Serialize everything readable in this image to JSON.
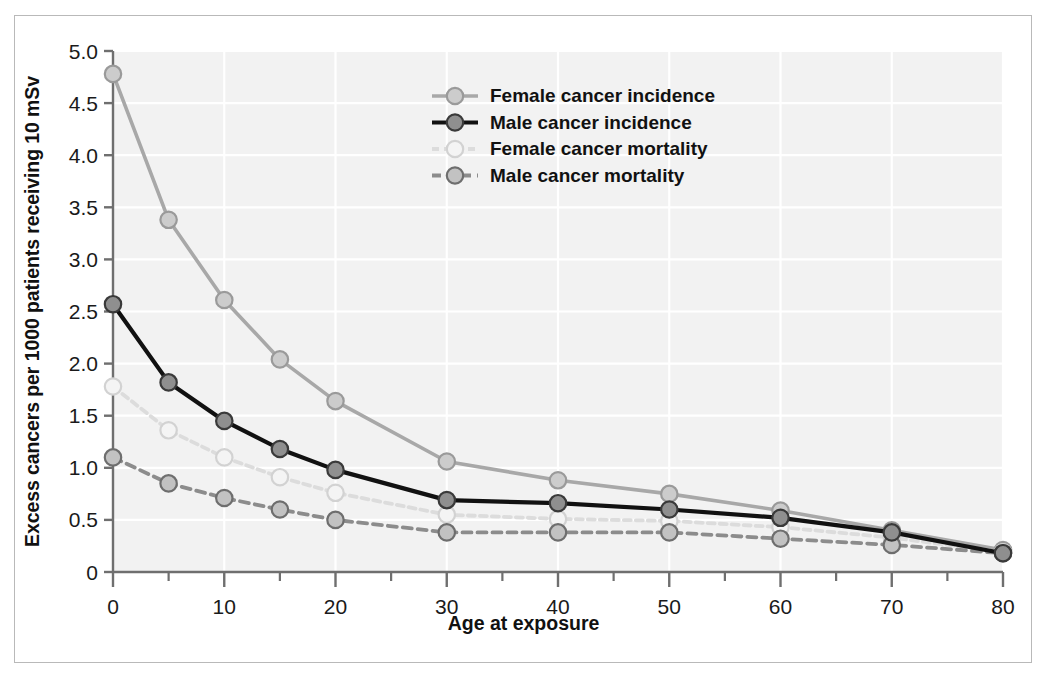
{
  "chart_data": {
    "type": "line",
    "title": "",
    "xlabel": "Age at exposure",
    "ylabel": "Excess cancers per 1000 patients receiving 10 mSv",
    "x": [
      0,
      5,
      10,
      15,
      20,
      30,
      40,
      50,
      60,
      70,
      80
    ],
    "xlim": [
      0,
      80
    ],
    "ylim": [
      0,
      5.0
    ],
    "xticks": [
      0,
      10,
      20,
      30,
      40,
      50,
      60,
      70,
      80
    ],
    "xtick_labels": [
      "0",
      "10",
      "20",
      "30",
      "40",
      "50",
      "60",
      "70",
      "80"
    ],
    "xminor_ticks": [
      5,
      15,
      25,
      35,
      45,
      55,
      65,
      75
    ],
    "yticks": [
      0,
      0.5,
      1.0,
      1.5,
      2.0,
      2.5,
      3.0,
      3.5,
      4.0,
      4.5,
      5.0
    ],
    "ytick_labels": [
      "0",
      "0.5",
      "1.0",
      "1.5",
      "2.0",
      "2.5",
      "3.0",
      "3.5",
      "4.0",
      "4.5",
      "5.0"
    ],
    "grid": true,
    "grid_color": "#ffffff",
    "plot_background": "#f2f2f2",
    "legend_position": "top-center",
    "series": [
      {
        "name": "Female cancer incidence",
        "values": [
          4.78,
          3.38,
          2.61,
          2.04,
          1.64,
          1.06,
          0.88,
          0.75,
          0.59,
          0.4,
          0.21
        ],
        "color": "#a8a8a8",
        "marker_fill": "#cccccc",
        "style": "solid"
      },
      {
        "name": "Male cancer incidence",
        "values": [
          2.57,
          1.82,
          1.45,
          1.18,
          0.98,
          0.69,
          0.66,
          0.6,
          0.52,
          0.38,
          0.18
        ],
        "color": "#111111",
        "marker_fill": "#8f8f8f",
        "style": "solid"
      },
      {
        "name": "Female cancer mortality",
        "values": [
          1.78,
          1.36,
          1.1,
          0.91,
          0.76,
          0.55,
          0.51,
          0.49,
          0.43,
          0.33,
          0.19
        ],
        "color": "#dcdcdc",
        "marker_fill": "#f4f4f4",
        "style": "dashed"
      },
      {
        "name": "Male cancer mortality",
        "values": [
          1.1,
          0.85,
          0.71,
          0.6,
          0.5,
          0.38,
          0.38,
          0.38,
          0.32,
          0.26,
          0.18
        ],
        "color": "#8c8c8c",
        "marker_fill": "#c2c2c2",
        "style": "dashed"
      }
    ]
  },
  "legend": {
    "items": [
      {
        "label": "Female cancer incidence"
      },
      {
        "label": "Male cancer incidence"
      },
      {
        "label": "Female cancer mortality"
      },
      {
        "label": "Male cancer mortality"
      }
    ]
  }
}
